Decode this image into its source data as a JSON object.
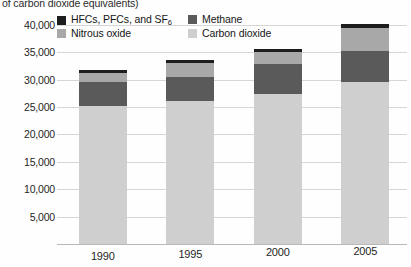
{
  "axis_caption": "of carbon dioxide equivalents)",
  "legend": {
    "items": [
      {
        "label": "HFCs, PFCs, and SF",
        "sub": "6",
        "color": "#1d1d1d",
        "name": "hfcs-pfcs-sf6"
      },
      {
        "label": "Methane",
        "sub": "",
        "color": "#5a5a5a",
        "name": "methane"
      },
      {
        "label": "Nitrous oxide",
        "sub": "",
        "color": "#a8a8a8",
        "name": "nitrous-oxide"
      },
      {
        "label": "Carbon dioxide",
        "sub": "",
        "color": "#cfcfcf",
        "name": "carbon-dioxide"
      }
    ]
  },
  "chart_data": {
    "type": "bar",
    "subtype": "stacked-bar",
    "title": "",
    "xlabel": "",
    "ylabel": "of carbon dioxide equivalents)",
    "categories": [
      "1990",
      "1995",
      "2000",
      "2005"
    ],
    "ylim": [
      0,
      42000
    ],
    "yticks": [
      5000,
      10000,
      15000,
      20000,
      25000,
      30000,
      35000,
      40000
    ],
    "ytick_labels": [
      "5,000",
      "10,000",
      "15,000",
      "20,000",
      "25,000",
      "30,000",
      "35,000",
      "40,000"
    ],
    "grid": true,
    "legend_position": "top-left-inside",
    "series": [
      {
        "name": "Carbon dioxide",
        "color": "#cfcfcf",
        "values": [
          25200,
          26200,
          27400,
          29500
        ]
      },
      {
        "name": "Methane",
        "color": "#5a5a5a",
        "values": [
          4400,
          4300,
          5500,
          5700
        ]
      },
      {
        "name": "Nitrous oxide",
        "color": "#a8a8a8",
        "values": [
          1700,
          2500,
          2200,
          4300
        ]
      },
      {
        "name": "HFCs, PFCs, and SF6",
        "color": "#1d1d1d",
        "values": [
          500,
          600,
          500,
          700
        ]
      }
    ],
    "totals": [
      31800,
      33600,
      35600,
      40200
    ]
  }
}
